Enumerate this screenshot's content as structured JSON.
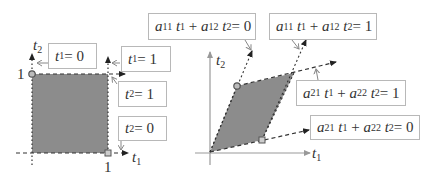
{
  "colors": {
    "fill": "#8c8c8c",
    "line": "#333333",
    "axis": "#999999",
    "box_border": "#b8b8b8"
  },
  "left_diagram": {
    "axis_x_label": {
      "var": "t",
      "sub": "1"
    },
    "axis_y_label": {
      "var": "t",
      "sub": "2"
    },
    "tick_x": "1",
    "tick_y": "1",
    "labels": [
      {
        "id": "t1-eq-0",
        "var": "t",
        "sub": "1",
        "rhs": "= 0"
      },
      {
        "id": "t1-eq-1",
        "var": "t",
        "sub": "1",
        "rhs": "= 1"
      },
      {
        "id": "t2-eq-1",
        "var": "t",
        "sub": "2",
        "rhs": "= 1"
      },
      {
        "id": "t2-eq-0",
        "var": "t",
        "sub": "2",
        "rhs": "= 0"
      }
    ]
  },
  "right_diagram": {
    "axis_x_label": {
      "var": "t",
      "sub": "1"
    },
    "axis_y_label": {
      "var": "t",
      "sub": "2"
    },
    "labels": [
      {
        "id": "a11-a12-eq-0",
        "c1": "a",
        "s1": "11",
        "c2": "a",
        "s2": "12",
        "rhs": "= 0"
      },
      {
        "id": "a11-a12-eq-1",
        "c1": "a",
        "s1": "11",
        "c2": "a",
        "s2": "12",
        "rhs": "= 1"
      },
      {
        "id": "a21-a22-eq-1",
        "c1": "a",
        "s1": "21",
        "c2": "a",
        "s2": "22",
        "rhs": "= 1"
      },
      {
        "id": "a21-a22-eq-0",
        "c1": "a",
        "s1": "21",
        "c2": "a",
        "s2": "22",
        "rhs": "= 0"
      }
    ]
  },
  "plus": "+"
}
